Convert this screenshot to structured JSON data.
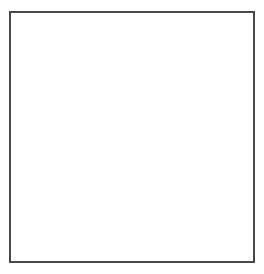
{
  "board": {
    "name": "go-board-diagram",
    "size": 19,
    "columns": 19,
    "rows": 19,
    "line_color": "#5a5a5a",
    "border_color": "#4a4a4a",
    "background_color": "#ffffff",
    "black_color": "#141414",
    "white_color": "#ffffff",
    "star_points": [
      {
        "col": 4,
        "row": 4
      },
      {
        "col": 10,
        "row": 4
      },
      {
        "col": 16,
        "row": 4
      },
      {
        "col": 4,
        "row": 10
      },
      {
        "col": 10,
        "row": 10
      },
      {
        "col": 16,
        "row": 10
      },
      {
        "col": 4,
        "row": 16
      },
      {
        "col": 10,
        "row": 16
      },
      {
        "col": 16,
        "row": 16
      }
    ],
    "stones": [
      {
        "col": 3,
        "row": 2,
        "color": "black",
        "label": ""
      },
      {
        "col": 4,
        "row": 2,
        "color": "black",
        "label": ""
      },
      {
        "col": 5,
        "row": 2,
        "color": "white",
        "label": ""
      },
      {
        "col": 3,
        "row": 3,
        "color": "black",
        "label": ""
      },
      {
        "col": 4,
        "row": 3,
        "color": "white",
        "label": ""
      },
      {
        "col": 5,
        "row": 3,
        "color": "white",
        "label": ""
      },
      {
        "col": 6,
        "row": 3,
        "color": "black",
        "label": ""
      },
      {
        "col": 9,
        "row": 3,
        "color": "white",
        "label": ""
      },
      {
        "col": 13,
        "row": 3,
        "color": "white",
        "label": "7"
      },
      {
        "col": 3,
        "row": 4,
        "color": "black",
        "label": ""
      },
      {
        "col": 4,
        "row": 4,
        "color": "white",
        "label": ""
      },
      {
        "col": 16,
        "row": 4,
        "color": "black",
        "label": ""
      },
      {
        "col": 4,
        "row": 5,
        "color": "white",
        "label": ""
      },
      {
        "col": 3,
        "row": 6,
        "color": "black",
        "label": ""
      },
      {
        "col": 17,
        "row": 9,
        "color": "black",
        "label": "8"
      },
      {
        "col": 16,
        "row": 11,
        "color": "white",
        "label": ""
      },
      {
        "col": 17,
        "row": 11,
        "color": "white",
        "label": "9"
      },
      {
        "col": 16,
        "row": 12,
        "color": "white",
        "label": ""
      },
      {
        "col": 17,
        "row": 12,
        "color": "black",
        "label": ""
      },
      {
        "col": 15,
        "row": 13,
        "color": "black",
        "label": ""
      },
      {
        "col": 18,
        "row": 13,
        "color": "white",
        "label": ""
      },
      {
        "col": 15,
        "row": 14,
        "color": "black",
        "label": ""
      },
      {
        "col": 16,
        "row": 14,
        "color": "white",
        "label": ""
      },
      {
        "col": 17,
        "row": 14,
        "color": "white",
        "label": ""
      },
      {
        "col": 3,
        "row": 14,
        "color": "white",
        "label": ""
      },
      {
        "col": 16,
        "row": 15,
        "color": "black",
        "label": ""
      },
      {
        "col": 17,
        "row": 15,
        "color": "black",
        "label": ""
      },
      {
        "col": 18,
        "row": 15,
        "color": "white",
        "label": ""
      },
      {
        "col": 12,
        "row": 15,
        "color": "white",
        "label": "3"
      },
      {
        "col": 4,
        "row": 16,
        "color": "white",
        "label": ""
      },
      {
        "col": 18,
        "row": 16,
        "color": "white",
        "label": ""
      },
      {
        "col": 10,
        "row": 16,
        "color": "black",
        "label": ""
      },
      {
        "col": 6,
        "row": 17,
        "color": "black",
        "label": ""
      },
      {
        "col": 10,
        "row": 17,
        "color": "black",
        "label": "2"
      },
      {
        "col": 11,
        "row": 17,
        "color": "white",
        "label": "1"
      },
      {
        "col": 12,
        "row": 17,
        "color": "white",
        "label": "5"
      },
      {
        "col": 16,
        "row": 17,
        "color": "black",
        "label": ""
      },
      {
        "col": 17,
        "row": 17,
        "color": "black",
        "label": ""
      },
      {
        "col": 4,
        "row": 18,
        "color": "black",
        "label": "10"
      },
      {
        "col": 11,
        "row": 18,
        "color": "black",
        "label": "4"
      },
      {
        "col": 12,
        "row": 18,
        "color": "black",
        "label": "6"
      }
    ],
    "move_sequence": [
      {
        "number": "1",
        "color": "white"
      },
      {
        "number": "2",
        "color": "black"
      },
      {
        "number": "3",
        "color": "white"
      },
      {
        "number": "4",
        "color": "black"
      },
      {
        "number": "5",
        "color": "white"
      },
      {
        "number": "6",
        "color": "black"
      },
      {
        "number": "7",
        "color": "white"
      },
      {
        "number": "8",
        "color": "black"
      },
      {
        "number": "9",
        "color": "white"
      },
      {
        "number": "10",
        "color": "black"
      }
    ]
  }
}
